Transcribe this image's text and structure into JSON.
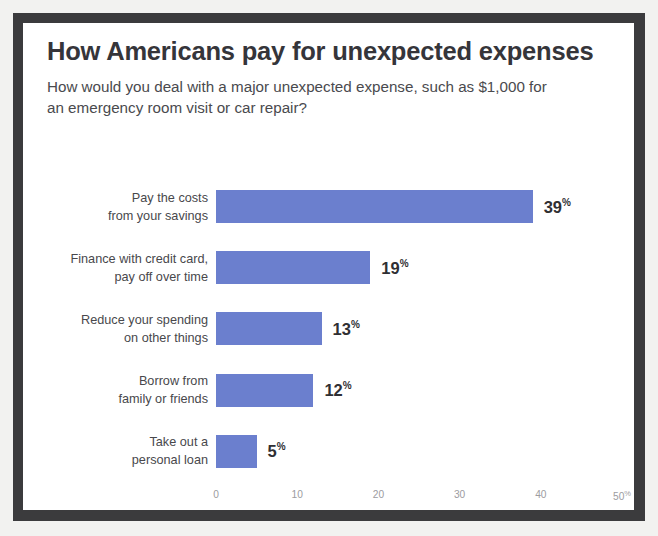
{
  "chart_data": {
    "type": "bar",
    "orientation": "horizontal",
    "title": "How Americans pay for unexpected expenses",
    "subtitle": "How would you deal with a major unexpected expense, such as $1,000 for an emergency room visit or car repair?",
    "xlabel": "",
    "ylabel": "",
    "xlim": [
      0,
      50
    ],
    "grid": false,
    "legend": null,
    "bar_color": "#6b7fce",
    "value_suffix": "%",
    "categories": [
      "Pay the costs\nfrom your savings",
      "Finance with credit card,\npay off over time",
      "Reduce your spending\non other things",
      "Borrow from\nfamily or friends",
      "Take out a\npersonal loan"
    ],
    "values": [
      39,
      19,
      13,
      12,
      5
    ],
    "value_labels": [
      "39",
      "19",
      "13",
      "12",
      "5"
    ],
    "ticks": [
      {
        "value": 0,
        "label": "0",
        "suffix": ""
      },
      {
        "value": 10,
        "label": "10",
        "suffix": ""
      },
      {
        "value": 20,
        "label": "20",
        "suffix": ""
      },
      {
        "value": 30,
        "label": "30",
        "suffix": ""
      },
      {
        "value": 40,
        "label": "40",
        "suffix": ""
      },
      {
        "value": 50,
        "label": "50",
        "suffix": "%"
      }
    ]
  }
}
